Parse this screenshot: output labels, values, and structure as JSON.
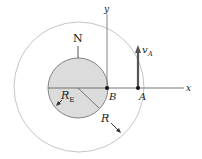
{
  "diagram": {
    "type": "orbital-geometry",
    "colors": {
      "earth_fill": "#dcdcdc",
      "earth_stroke": "#777777",
      "orbit_stroke": "#bdbdbd",
      "axis_stroke": "#555555",
      "vector_color": "#555555"
    },
    "labels": {
      "north": "N",
      "y_axis": "y",
      "x_axis": "x",
      "point_b": "B",
      "point_a": "A",
      "earth_radius": "R",
      "earth_radius_sub": "E",
      "orbit_radius": "R",
      "velocity": "v",
      "velocity_sub": "A"
    }
  }
}
